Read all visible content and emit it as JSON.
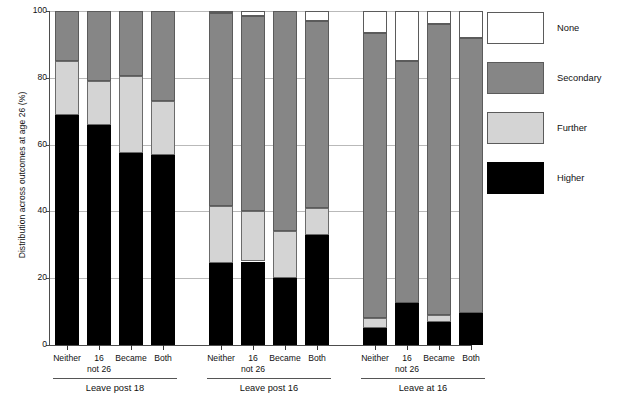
{
  "chart_data": {
    "type": "bar",
    "subtype": "stacked-bar-100",
    "title": "",
    "xlabel": "",
    "ylabel": "Distribution across outcomes at age 26 (%)",
    "ylim": [
      0,
      100
    ],
    "yticks": [
      0,
      20,
      40,
      60,
      80,
      100
    ],
    "ytick_labels": [
      "0",
      "20",
      "40",
      "60",
      "80",
      "100"
    ],
    "grid": "horizontal",
    "legend_position": "right",
    "legend": [
      {
        "label": "None",
        "color": "#ffffff"
      },
      {
        "label": "Secondary",
        "color": "#868686"
      },
      {
        "label": "Further",
        "color": "#d4d4d4"
      },
      {
        "label": "Higher",
        "color": "#000000"
      }
    ],
    "categories": [
      "Neither",
      "16 not 26",
      "Became",
      "Both"
    ],
    "category_labels_line1": [
      "Neither",
      "16",
      "Became",
      "Both"
    ],
    "category_labels_line2": [
      "",
      "not 26",
      "",
      ""
    ],
    "groups": [
      {
        "name": "Leave post 18",
        "bars": [
          {
            "category": "Neither",
            "Higher": 69.0,
            "Further": 16.0,
            "Secondary": 15.0,
            "None": 0.0
          },
          {
            "category": "16 not 26",
            "Higher": 66.0,
            "Further": 13.0,
            "Secondary": 21.0,
            "None": 0.0
          },
          {
            "category": "Became",
            "Higher": 57.5,
            "Further": 23.0,
            "Secondary": 19.5,
            "None": 0.0
          },
          {
            "category": "Both",
            "Higher": 57.0,
            "Further": 16.0,
            "Secondary": 27.0,
            "None": 0.0
          }
        ]
      },
      {
        "name": "Leave post 16",
        "bars": [
          {
            "category": "Neither",
            "Higher": 24.5,
            "Further": 17.0,
            "Secondary": 58.0,
            "None": 0.5
          },
          {
            "category": "16 not 26",
            "Higher": 25.0,
            "Further": 15.0,
            "Secondary": 58.5,
            "None": 1.5
          },
          {
            "category": "Became",
            "Higher": 20.0,
            "Further": 14.0,
            "Secondary": 66.0,
            "None": 0.0
          },
          {
            "category": "Both",
            "Higher": 33.0,
            "Further": 8.0,
            "Secondary": 56.0,
            "None": 3.0
          }
        ]
      },
      {
        "name": "Leave at 16",
        "bars": [
          {
            "category": "Neither",
            "Higher": 5.0,
            "Further": 3.0,
            "Secondary": 85.5,
            "None": 6.5
          },
          {
            "category": "16 not 26",
            "Higher": 12.5,
            "Further": 0.0,
            "Secondary": 72.5,
            "None": 15.0
          },
          {
            "category": "Became",
            "Higher": 7.0,
            "Further": 2.0,
            "Secondary": 87.0,
            "None": 4.0
          },
          {
            "category": "Both",
            "Higher": 9.5,
            "Further": 0.0,
            "Secondary": 82.5,
            "None": 8.0
          }
        ]
      }
    ]
  }
}
